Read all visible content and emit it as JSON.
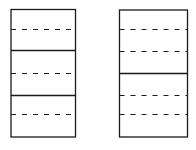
{
  "colors": {
    "background": "#ffffff",
    "stroke": "#1a1a1a"
  },
  "diagram": {
    "panels": [
      {
        "name": "left-panel",
        "box": {
          "x": 11,
          "y": 9.5,
          "w": 64.5,
          "h": 127.5
        },
        "lines": [
          {
            "y": 29,
            "style": "dashed"
          },
          {
            "y": 50,
            "style": "solid"
          },
          {
            "y": 73,
            "style": "dashed"
          },
          {
            "y": 95,
            "style": "solid"
          },
          {
            "y": 114,
            "style": "dashed"
          }
        ]
      },
      {
        "name": "right-panel",
        "box": {
          "x": 119.5,
          "y": 10,
          "w": 68,
          "h": 127
        },
        "lines": [
          {
            "y": 29,
            "style": "dashed"
          },
          {
            "y": 51,
            "style": "dashed"
          },
          {
            "y": 73,
            "style": "solid"
          },
          {
            "y": 95,
            "style": "dashed"
          },
          {
            "y": 114,
            "style": "dashed"
          }
        ]
      }
    ]
  }
}
